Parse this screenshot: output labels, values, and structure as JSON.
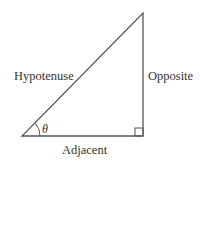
{
  "diagram": {
    "labels": {
      "hypotenuse": "Hypotenuse",
      "opposite": "Opposite",
      "adjacent": "Adjacent",
      "angle": "θ"
    },
    "colors": {
      "stroke": "#555555",
      "text": "#333333",
      "background": "#ffffff"
    }
  }
}
